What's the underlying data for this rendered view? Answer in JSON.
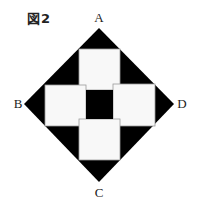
{
  "figure": {
    "title": "図2",
    "vertices": {
      "A": {
        "label": "A",
        "x": 99,
        "y": 28
      },
      "B": {
        "label": "B",
        "x": 24,
        "y": 104
      },
      "C": {
        "label": "C",
        "x": 99,
        "y": 182
      },
      "D": {
        "label": "D",
        "x": 174,
        "y": 104
      }
    },
    "colors": {
      "fill_dark": "#000000",
      "fill_light": "#f8f8f8",
      "square_border": "#9a9a9a"
    },
    "squares": [
      {
        "name": "top",
        "x": 79,
        "y": 49,
        "w": 41,
        "h": 41
      },
      {
        "name": "left",
        "x": 45,
        "y": 85,
        "w": 41,
        "h": 41
      },
      {
        "name": "right",
        "x": 113,
        "y": 84,
        "w": 42,
        "h": 42
      },
      {
        "name": "bottom",
        "x": 79,
        "y": 119,
        "w": 41,
        "h": 41
      }
    ],
    "center_square": {
      "x": 86,
      "y": 90,
      "w": 27,
      "h": 29
    }
  }
}
